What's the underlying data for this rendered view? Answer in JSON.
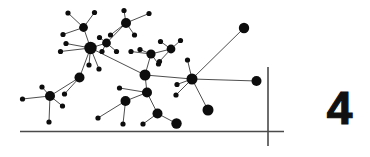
{
  "figure": {
    "label": "4",
    "label_color": "#111111",
    "background_color": "#ffffff",
    "width": 370,
    "height": 157
  },
  "axes": {
    "line_color": "#4a4a4a",
    "stroke_width": 1.6,
    "x_axis": {
      "x1": 20,
      "y1": 131.5,
      "x2": 284,
      "y2": 131.5
    },
    "y_axis": {
      "x1": 268,
      "y1": 67,
      "x2": 268,
      "y2": 146
    }
  },
  "graph": {
    "type": "node-link-network",
    "node_color": "#0d0d0d",
    "edge_color": "#3a3a3a",
    "edge_width": 0.9,
    "nodes": [
      {
        "id": "n0",
        "x": 90.5,
        "y": 48.0,
        "r": 6.2
      },
      {
        "id": "n1",
        "x": 83.5,
        "y": 27.5,
        "r": 4.4
      },
      {
        "id": "n2",
        "x": 68.0,
        "y": 13.0,
        "r": 2.6
      },
      {
        "id": "n3",
        "x": 94.5,
        "y": 12.5,
        "r": 2.6
      },
      {
        "id": "n4",
        "x": 63.0,
        "y": 34.5,
        "r": 2.6
      },
      {
        "id": "n5",
        "x": 66.0,
        "y": 43.5,
        "r": 2.6
      },
      {
        "id": "n6",
        "x": 60.5,
        "y": 51.5,
        "r": 2.6
      },
      {
        "id": "n7",
        "x": 89.0,
        "y": 65.0,
        "r": 2.6
      },
      {
        "id": "n8",
        "x": 99.0,
        "y": 69.0,
        "r": 2.6
      },
      {
        "id": "n9",
        "x": 79.5,
        "y": 77.5,
        "r": 5.0
      },
      {
        "id": "n10",
        "x": 50.0,
        "y": 96.0,
        "r": 5.0
      },
      {
        "id": "n11",
        "x": 22.5,
        "y": 99.0,
        "r": 2.6
      },
      {
        "id": "n12",
        "x": 42.0,
        "y": 87.0,
        "r": 2.6
      },
      {
        "id": "n13",
        "x": 64.5,
        "y": 94.0,
        "r": 2.6
      },
      {
        "id": "n14",
        "x": 62.5,
        "y": 106.0,
        "r": 2.6
      },
      {
        "id": "n15",
        "x": 49.0,
        "y": 122.0,
        "r": 2.6
      },
      {
        "id": "n16",
        "x": 106.5,
        "y": 43.0,
        "r": 4.4
      },
      {
        "id": "n17",
        "x": 99.5,
        "y": 37.5,
        "r": 2.6
      },
      {
        "id": "n18",
        "x": 102.0,
        "y": 51.5,
        "r": 2.6
      },
      {
        "id": "n19",
        "x": 116.5,
        "y": 51.5,
        "r": 2.6
      },
      {
        "id": "n20",
        "x": 126.0,
        "y": 23.0,
        "r": 5.0
      },
      {
        "id": "n21",
        "x": 124.0,
        "y": 10.5,
        "r": 2.6
      },
      {
        "id": "n22",
        "x": 149.0,
        "y": 13.5,
        "r": 2.6
      },
      {
        "id": "n23",
        "x": 134.5,
        "y": 35.0,
        "r": 2.6
      },
      {
        "id": "n24",
        "x": 110.5,
        "y": 35.0,
        "r": 2.6
      },
      {
        "id": "n25",
        "x": 145.0,
        "y": 75.0,
        "r": 5.5
      },
      {
        "id": "n26",
        "x": 151.0,
        "y": 54.0,
        "r": 4.6
      },
      {
        "id": "n27",
        "x": 140.0,
        "y": 49.5,
        "r": 2.6
      },
      {
        "id": "n28",
        "x": 158.5,
        "y": 64.0,
        "r": 2.6
      },
      {
        "id": "n29",
        "x": 131.0,
        "y": 51.5,
        "r": 2.6
      },
      {
        "id": "n30",
        "x": 171.0,
        "y": 49.0,
        "r": 4.4
      },
      {
        "id": "n31",
        "x": 160.5,
        "y": 41.5,
        "r": 2.6
      },
      {
        "id": "n32",
        "x": 180.5,
        "y": 40.5,
        "r": 2.6
      },
      {
        "id": "n33",
        "x": 159.5,
        "y": 61.5,
        "r": 2.6
      },
      {
        "id": "n34",
        "x": 147.0,
        "y": 92.5,
        "r": 5.0
      },
      {
        "id": "n35",
        "x": 119.5,
        "y": 88.0,
        "r": 2.6
      },
      {
        "id": "n36",
        "x": 125.5,
        "y": 101.0,
        "r": 5.0
      },
      {
        "id": "n37",
        "x": 98.0,
        "y": 118.0,
        "r": 2.6
      },
      {
        "id": "n38",
        "x": 123.0,
        "y": 124.0,
        "r": 2.6
      },
      {
        "id": "n39",
        "x": 157.5,
        "y": 113.5,
        "r": 5.0
      },
      {
        "id": "n40",
        "x": 143.0,
        "y": 124.0,
        "r": 2.6
      },
      {
        "id": "n41",
        "x": 176.5,
        "y": 123.5,
        "r": 5.2
      },
      {
        "id": "n42",
        "x": 192.0,
        "y": 79.0,
        "r": 5.5
      },
      {
        "id": "n43",
        "x": 187.5,
        "y": 60.0,
        "r": 2.6
      },
      {
        "id": "n44",
        "x": 244.0,
        "y": 28.0,
        "r": 5.2
      },
      {
        "id": "n45",
        "x": 256.5,
        "y": 81.0,
        "r": 5.0
      },
      {
        "id": "n46",
        "x": 177.0,
        "y": 84.5,
        "r": 2.6
      },
      {
        "id": "n47",
        "x": 176.0,
        "y": 95.0,
        "r": 2.6
      },
      {
        "id": "n48",
        "x": 208.0,
        "y": 110.0,
        "r": 5.5
      }
    ],
    "edges": [
      [
        "n0",
        "n1"
      ],
      [
        "n1",
        "n2"
      ],
      [
        "n1",
        "n3"
      ],
      [
        "n1",
        "n4"
      ],
      [
        "n0",
        "n5"
      ],
      [
        "n0",
        "n6"
      ],
      [
        "n0",
        "n7"
      ],
      [
        "n0",
        "n8"
      ],
      [
        "n0",
        "n9"
      ],
      [
        "n0",
        "n16"
      ],
      [
        "n0",
        "n25"
      ],
      [
        "n9",
        "n10"
      ],
      [
        "n9",
        "n13"
      ],
      [
        "n10",
        "n11"
      ],
      [
        "n10",
        "n12"
      ],
      [
        "n10",
        "n14"
      ],
      [
        "n10",
        "n15"
      ],
      [
        "n16",
        "n17"
      ],
      [
        "n16",
        "n18"
      ],
      [
        "n16",
        "n19"
      ],
      [
        "n16",
        "n20"
      ],
      [
        "n20",
        "n21"
      ],
      [
        "n20",
        "n22"
      ],
      [
        "n20",
        "n23"
      ],
      [
        "n20",
        "n24"
      ],
      [
        "n25",
        "n26"
      ],
      [
        "n25",
        "n34"
      ],
      [
        "n25",
        "n42"
      ],
      [
        "n26",
        "n27"
      ],
      [
        "n26",
        "n28"
      ],
      [
        "n26",
        "n29"
      ],
      [
        "n26",
        "n30"
      ],
      [
        "n30",
        "n31"
      ],
      [
        "n30",
        "n32"
      ],
      [
        "n30",
        "n33"
      ],
      [
        "n34",
        "n35"
      ],
      [
        "n34",
        "n36"
      ],
      [
        "n34",
        "n39"
      ],
      [
        "n36",
        "n37"
      ],
      [
        "n36",
        "n38"
      ],
      [
        "n39",
        "n40"
      ],
      [
        "n39",
        "n41"
      ],
      [
        "n42",
        "n43"
      ],
      [
        "n42",
        "n44"
      ],
      [
        "n42",
        "n45"
      ],
      [
        "n42",
        "n46"
      ],
      [
        "n42",
        "n47"
      ],
      [
        "n42",
        "n48"
      ]
    ]
  }
}
